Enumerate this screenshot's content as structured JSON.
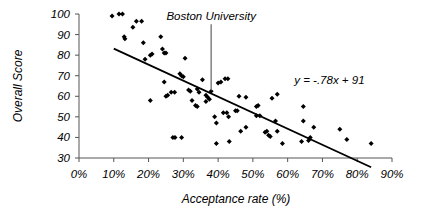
{
  "chart_data": {
    "type": "scatter",
    "title": "",
    "xlabel": "Acceptance rate (%)",
    "ylabel": "Overall Score",
    "xlim": [
      0,
      90
    ],
    "ylim": [
      30,
      100
    ],
    "xticks": [
      "0%",
      "10%",
      "20%",
      "30%",
      "40%",
      "50%",
      "60%",
      "70%",
      "80%",
      "90%"
    ],
    "xtick_values": [
      0,
      10,
      20,
      30,
      40,
      50,
      60,
      70,
      80,
      90
    ],
    "yticks": [
      "30",
      "40",
      "50",
      "60",
      "70",
      "80",
      "90",
      "100"
    ],
    "ytick_values": [
      30,
      40,
      50,
      60,
      70,
      80,
      90,
      100
    ],
    "grid": false,
    "legend": "none",
    "marker": "diamond",
    "marker_color": "#000000",
    "trendline": {
      "equation": "y = -.78x + 91",
      "slope": -0.78,
      "intercept": 91,
      "x_start": 10,
      "x_end": 84
    },
    "annotations": [
      {
        "label": "Boston University",
        "x": 38,
        "y": 62,
        "pointer": true,
        "label_x": 38,
        "label_y": 97
      },
      {
        "label": "y = -.78x + 91",
        "x": 72,
        "y": 66,
        "pointer": false
      }
    ],
    "points": [
      [
        9.5,
        99
      ],
      [
        11.5,
        100
      ],
      [
        12.5,
        100
      ],
      [
        13.0,
        89
      ],
      [
        13.2,
        88
      ],
      [
        15.5,
        93.5
      ],
      [
        16.5,
        96.5
      ],
      [
        18.0,
        96.5
      ],
      [
        18.5,
        86
      ],
      [
        19.0,
        78
      ],
      [
        20.5,
        80
      ],
      [
        21.0,
        80.5
      ],
      [
        23.5,
        89
      ],
      [
        24.0,
        83
      ],
      [
        24.5,
        81
      ],
      [
        25.0,
        81
      ],
      [
        20.5,
        58
      ],
      [
        24.5,
        67
      ],
      [
        25.0,
        60
      ],
      [
        25.5,
        60.5
      ],
      [
        26.5,
        62
      ],
      [
        27.5,
        62
      ],
      [
        27.0,
        40
      ],
      [
        27.6,
        40
      ],
      [
        29.5,
        40
      ],
      [
        29.0,
        71
      ],
      [
        29.5,
        70
      ],
      [
        30.0,
        69.5
      ],
      [
        30.5,
        78.5
      ],
      [
        31.5,
        63
      ],
      [
        32.0,
        62.5
      ],
      [
        32.5,
        58
      ],
      [
        34.0,
        63.5
      ],
      [
        34.5,
        62
      ],
      [
        33.5,
        55.5
      ],
      [
        34.0,
        55
      ],
      [
        35.5,
        68
      ],
      [
        36.5,
        60.5
      ],
      [
        37.0,
        59.5
      ],
      [
        36.5,
        57.5
      ],
      [
        37.5,
        58.5
      ],
      [
        38.0,
        62.5
      ],
      [
        39.0,
        50
      ],
      [
        39.5,
        47
      ],
      [
        39.5,
        37
      ],
      [
        40.0,
        66.5
      ],
      [
        40.8,
        67
      ],
      [
        42.0,
        68.5
      ],
      [
        42.8,
        68.5
      ],
      [
        41.5,
        52
      ],
      [
        42.5,
        52
      ],
      [
        43.0,
        50
      ],
      [
        43.2,
        38
      ],
      [
        45.0,
        53
      ],
      [
        45.5,
        53
      ],
      [
        46.0,
        60
      ],
      [
        48.0,
        59.5
      ],
      [
        46.5,
        43
      ],
      [
        48.0,
        45
      ],
      [
        51.0,
        55
      ],
      [
        51.5,
        55.5
      ],
      [
        51.0,
        50.5
      ],
      [
        52.0,
        50.5
      ],
      [
        53.5,
        42.5
      ],
      [
        54.0,
        43
      ],
      [
        54.5,
        41
      ],
      [
        55.0,
        40.5
      ],
      [
        55.5,
        59
      ],
      [
        57.0,
        61
      ],
      [
        56.5,
        48
      ],
      [
        57.0,
        43
      ],
      [
        58.5,
        37
      ],
      [
        64.5,
        55
      ],
      [
        64.5,
        48
      ],
      [
        64.0,
        38
      ],
      [
        66.0,
        38.5
      ],
      [
        66.5,
        40
      ],
      [
        67.5,
        45
      ],
      [
        75.0,
        44
      ],
      [
        77.0,
        39
      ],
      [
        84.0,
        37
      ]
    ]
  },
  "geometry": {
    "plot_left": 79,
    "plot_right": 392,
    "plot_top": 14,
    "plot_bottom": 158
  }
}
